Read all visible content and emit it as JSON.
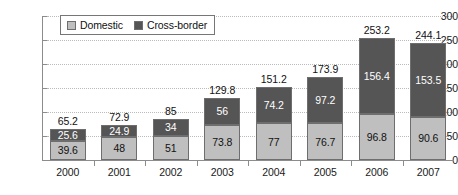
{
  "chart_data": {
    "type": "bar",
    "stacked": true,
    "title": "",
    "subtitle": "",
    "xlabel": "",
    "ylabel": "",
    "categories": [
      "2000",
      "2001",
      "2002",
      "2003",
      "2004",
      "2005",
      "2006",
      "2007"
    ],
    "series": [
      {
        "name": "Domestic",
        "color": "#bfbfbf",
        "values": [
          39.6,
          48,
          51,
          73.8,
          77,
          76.7,
          96.8,
          90.6
        ],
        "labels": [
          "39.6",
          "48",
          "51",
          "73.8",
          "77",
          "76.7",
          "96.8",
          "90.6"
        ]
      },
      {
        "name": "Cross-border",
        "color": "#555555",
        "values": [
          25.6,
          24.9,
          34,
          56,
          74.2,
          97.2,
          156.4,
          153.5
        ],
        "labels": [
          "25.6",
          "24.9",
          "34",
          "56",
          "74.2",
          "97.2",
          "156.4",
          "153.5"
        ]
      }
    ],
    "totals": [
      65.2,
      72.9,
      85,
      129.8,
      151.2,
      173.9,
      253.2,
      244.1
    ],
    "total_labels": [
      "65.2",
      "72.9",
      "85",
      "129.8",
      "151.2",
      "173.9",
      "253.2",
      "244.1"
    ],
    "ylim": [
      0,
      300
    ],
    "yticks": [
      0,
      50,
      100,
      150,
      200,
      250,
      300
    ],
    "ytick_labels": [
      "0",
      "50",
      "100",
      "150",
      "200",
      "250",
      "300"
    ],
    "grid": true,
    "legend_position": "top-left-inside"
  },
  "legend": {
    "items": [
      {
        "label": "Domestic",
        "swatch": "legend-swatch-domestic"
      },
      {
        "label": "Cross-border",
        "swatch": "legend-swatch-cross-border"
      }
    ]
  }
}
